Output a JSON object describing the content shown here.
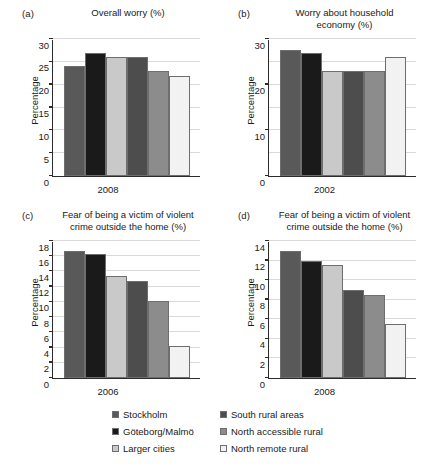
{
  "figure": {
    "ylabel": "Percentage",
    "legend": {
      "entries": [
        {
          "label": "Stockholm",
          "color": "#595959"
        },
        {
          "label": "South rural areas",
          "color": "#4d4d4d"
        },
        {
          "label": "Göteborg/Malmö",
          "color": "#1a1a1a"
        },
        {
          "label": "North accessible rural",
          "color": "#8c8c8c"
        },
        {
          "label": "Larger cities",
          "color": "#c9c9c9"
        },
        {
          "label": "North remote rural",
          "color": "#f2f2f2"
        }
      ]
    },
    "series_colors": [
      "#595959",
      "#1a1a1a",
      "#c9c9c9",
      "#4d4d4d",
      "#8c8c8c",
      "#f2f2f2"
    ]
  },
  "chart_data": [
    {
      "type": "bar",
      "panel": "(a)",
      "title": "Overall worry (%)",
      "xlabel": "2008",
      "ylabel": "Percentage",
      "categories": [
        "Stockholm",
        "Göteborg/Malmö",
        "Larger cities",
        "South rural areas",
        "North accessible rural",
        "North remote rural"
      ],
      "values": [
        24,
        27,
        26,
        26,
        23,
        22
      ],
      "ylim": [
        0,
        30
      ],
      "yticks": [
        0,
        5,
        10,
        15,
        20,
        25,
        30
      ],
      "grid": true,
      "legend_position": "bottom"
    },
    {
      "type": "bar",
      "panel": "(b)",
      "title": "Worry about household economy (%)",
      "title_line1": "Worry about household",
      "title_line2": "economy (%)",
      "xlabel": "2002",
      "ylabel": "Percentage",
      "categories": [
        "Stockholm",
        "Göteborg/Malmö",
        "Larger cities",
        "South rural areas",
        "North accessible rural",
        "North remote rural"
      ],
      "values": [
        27.5,
        27,
        23,
        23,
        23,
        26
      ],
      "ylim": [
        0,
        30
      ],
      "yticks": [
        0,
        10,
        20,
        30
      ],
      "minor_yticks": [
        5,
        15,
        25
      ],
      "grid": true,
      "legend_position": "bottom"
    },
    {
      "type": "bar",
      "panel": "(c)",
      "title": "Fear of being a victim of violent crime outside the home (%)",
      "title_line1": "Fear of being a victim of violent",
      "title_line2": "crime outside the home (%)",
      "xlabel": "2006",
      "ylabel": "Percentage",
      "categories": [
        "Stockholm",
        "Göteborg/Malmö",
        "Larger cities",
        "South rural areas",
        "North accessible rural",
        "North remote rural"
      ],
      "values": [
        16.7,
        16.3,
        13.4,
        12.7,
        10.1,
        4.2
      ],
      "ylim": [
        0,
        18
      ],
      "yticks": [
        0,
        2,
        4,
        6,
        8,
        10,
        12,
        14,
        16,
        18
      ],
      "grid": true,
      "legend_position": "bottom"
    },
    {
      "type": "bar",
      "panel": "(d)",
      "title": "Fear of being a victim of violent crime outside the home (%)",
      "title_line1": "Fear of being a victim of violent",
      "title_line2": "crime outside the home (%)",
      "xlabel": "2008",
      "ylabel": "Percentage",
      "categories": [
        "Stockholm",
        "Göteborg/Malmö",
        "Larger cities",
        "South rural areas",
        "North accessible rural",
        "North remote rural"
      ],
      "values": [
        13.0,
        12.0,
        11.5,
        9.0,
        8.5,
        5.5
      ],
      "ylim": [
        0,
        14
      ],
      "yticks": [
        0,
        2,
        4,
        6,
        8,
        10,
        12,
        14
      ],
      "grid": true,
      "legend_position": "bottom"
    }
  ]
}
